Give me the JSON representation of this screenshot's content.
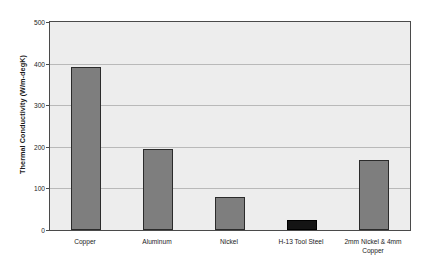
{
  "chart_data": {
    "type": "bar",
    "title": "",
    "subtitle": "",
    "xlabel": "",
    "ylabel": "Thermal Conductivity (W/m-degK)",
    "categories": [
      "Copper",
      "Aluminum",
      "Nickel",
      "H-13 Tool Steel",
      "2mm Nickel & 4mm Copper"
    ],
    "values": [
      393,
      194,
      80,
      25,
      169
    ],
    "ylim": [
      0,
      500
    ],
    "yticks": [
      0,
      100,
      200,
      300,
      400,
      500
    ],
    "ytick_labels": [
      "0",
      "100",
      "200",
      "300",
      "400",
      "500"
    ],
    "grid": true,
    "legend": "none",
    "series": [
      {
        "name": "Thermal Conductivity",
        "values": [
          393,
          194,
          80,
          25,
          169
        ]
      }
    ],
    "bar_colors": [
      "#7e7e7e",
      "#7e7e7e",
      "#7e7e7e",
      "#141414",
      "#7e7e7e"
    ],
    "plot_background": "#ededed",
    "axis_color": "#4a4a4a",
    "gridline_color": "#b9b9b9"
  },
  "axis": {
    "y_title": "Thermal Conductivity (W/m-degK)"
  },
  "x_labels": [
    {
      "line1": "Copper",
      "line2": ""
    },
    {
      "line1": "Aluminum",
      "line2": ""
    },
    {
      "line1": "Nickel",
      "line2": ""
    },
    {
      "line1": "H-13 Tool Steel",
      "line2": ""
    },
    {
      "line1": "2mm Nickel & 4mm",
      "line2": "Copper"
    }
  ]
}
